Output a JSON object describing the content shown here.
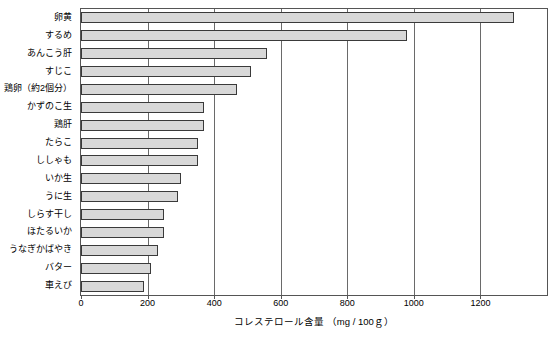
{
  "chart_data": {
    "type": "bar",
    "orientation": "horizontal",
    "title": "",
    "xlabel": "コレステロール含量 （mg / 100ｇ）",
    "ylabel": "",
    "xlim": [
      0,
      1400
    ],
    "xticks": [
      0,
      200,
      400,
      600,
      800,
      1000,
      1200
    ],
    "xtick_labels": [
      "0",
      "200",
      "400",
      "600",
      "800",
      "1000",
      "1200"
    ],
    "grid": true,
    "legend": null,
    "categories": [
      "卵黄",
      "するめ",
      "あんこう肝",
      "すじこ",
      "鶏卵（約2個分）",
      "かずのこ生",
      "鶏肝",
      "たらこ",
      "ししゃも",
      "いか生",
      "うに生",
      "しらす干し",
      "ほたるいか",
      "うなぎかばやき",
      "バター",
      "車えび"
    ],
    "values": [
      1300,
      980,
      560,
      510,
      470,
      370,
      370,
      350,
      350,
      300,
      290,
      250,
      250,
      230,
      210,
      190
    ]
  }
}
